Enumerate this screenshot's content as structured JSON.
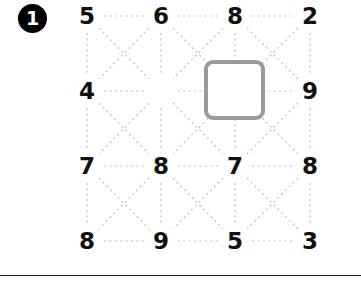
{
  "panel": {
    "question_number": "1",
    "badge_bg": "#000000",
    "badge_fg": "#ffffff"
  },
  "grid": {
    "rows": 4,
    "cols": 4,
    "col_x": [
      15,
      89,
      163,
      238
    ],
    "row_y": [
      16,
      91,
      166,
      241
    ],
    "cells": [
      [
        {
          "value": "5",
          "hidden": false
        },
        {
          "value": "6",
          "hidden": false
        },
        {
          "value": "8",
          "hidden": false
        },
        {
          "value": "2",
          "hidden": false
        }
      ],
      [
        {
          "value": "4",
          "hidden": false
        },
        {
          "value": "",
          "hidden": true
        },
        {
          "value": "7",
          "hidden": false
        },
        {
          "value": "9",
          "hidden": false
        }
      ],
      [
        {
          "value": "7",
          "hidden": false
        },
        {
          "value": "8",
          "hidden": false
        },
        {
          "value": "7",
          "hidden": false
        },
        {
          "value": "8",
          "hidden": false
        }
      ],
      [
        {
          "value": "8",
          "hidden": false
        },
        {
          "value": "9",
          "hidden": false
        },
        {
          "value": "5",
          "hidden": false
        },
        {
          "value": "3",
          "hidden": false
        }
      ]
    ],
    "connector_color": "#bdbdbd",
    "connector_style": "dotted"
  },
  "answer_box": {
    "label": "",
    "border_color": "#9a9a9a",
    "missing_cell_row": 1,
    "missing_cell_col": 1
  },
  "rule": {
    "color": "#1a1a1a"
  }
}
